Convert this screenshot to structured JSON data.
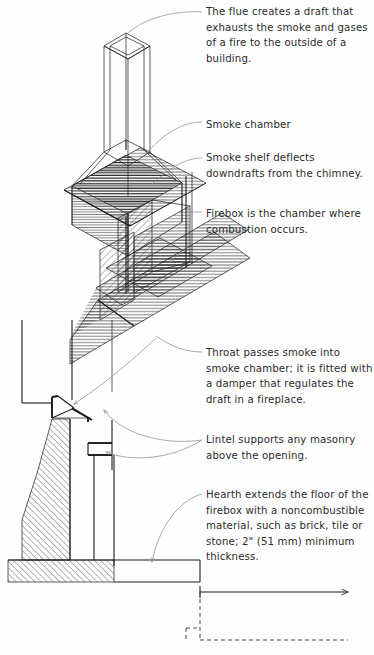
{
  "diagram": {
    "type": "technical-isometric-section",
    "ink_color": "#1a1a1a",
    "leader_color": "#8d8d8d",
    "text_color": "#2b2b2b",
    "background": "#fefefe"
  },
  "annotations": [
    {
      "id": "flue",
      "term": "Flue",
      "text": "The flue creates a draft that exhausts the smoke and gases of a fire to the outside of a building.",
      "x": 206,
      "y": 4
    },
    {
      "id": "smoke-chamber",
      "term": "Smoke chamber",
      "text": "Smoke chamber",
      "x": 206,
      "y": 117
    },
    {
      "id": "smoke-shelf",
      "term": "Smoke shelf",
      "text": "Smoke shelf deflects downdrafts from the chimney.",
      "x": 206,
      "y": 150
    },
    {
      "id": "firebox",
      "term": "Firebox",
      "text": "Firebox is the chamber where combustion occurs.",
      "x": 206,
      "y": 206
    },
    {
      "id": "throat",
      "term": "Throat",
      "text": "Throat passes smoke into smoke chamber; it is fitted with a damper that regulates the draft in a fireplace.",
      "x": 206,
      "y": 345
    },
    {
      "id": "lintel",
      "term": "Lintel",
      "text": "Lintel supports any masonry above the opening.",
      "x": 206,
      "y": 432
    },
    {
      "id": "hearth",
      "term": "Hearth",
      "text": "Hearth extends the floor of the firebox with a noncombustible material, such as brick, tile or stone; 2\" (51 mm) minimum thickness.",
      "x": 206,
      "y": 487
    }
  ],
  "measurements": {
    "hearth_thickness_imperial": "2\"",
    "hearth_thickness_metric": "51 mm"
  },
  "parts": [
    {
      "name": "flue",
      "label": "flue-column"
    },
    {
      "name": "smoke-chamber",
      "label": "smoke-chamber-taper"
    },
    {
      "name": "smoke-shelf",
      "label": "smoke-shelf-plane"
    },
    {
      "name": "firebox",
      "label": "firebox-cavity"
    },
    {
      "name": "throat",
      "label": "throat-plane"
    },
    {
      "name": "lintel",
      "label": "lintel-bracket"
    },
    {
      "name": "hearth",
      "label": "hearth-slab"
    },
    {
      "name": "masonry-wall",
      "label": "masonry-wall-section"
    }
  ]
}
